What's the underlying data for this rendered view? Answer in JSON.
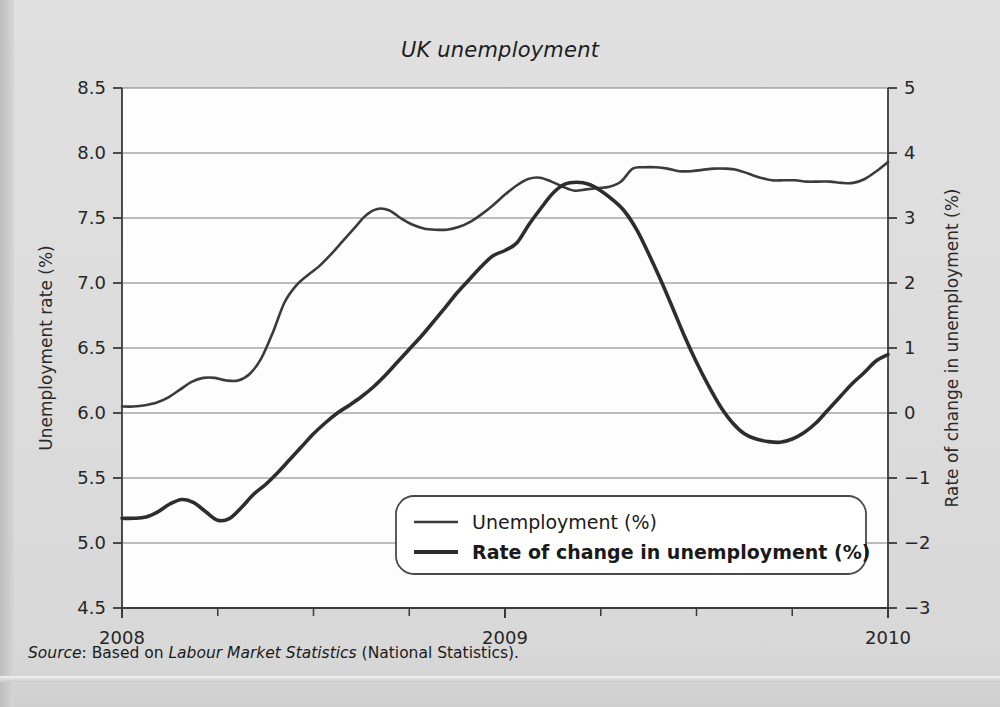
{
  "figure": {
    "title": "UK unemployment",
    "source_prefix": "Source",
    "source_text": ": Based on ",
    "source_italic": "Labour Market Statistics",
    "source_suffix": " (National Statistics)."
  },
  "chart_data": {
    "type": "line",
    "title": "UK unemployment",
    "xlabel": "",
    "x_tick_labels": [
      "2008",
      "2009",
      "2010"
    ],
    "x_tick_values": [
      2008,
      2009,
      2010
    ],
    "xlim": [
      2008,
      2010
    ],
    "x_minor_ticks_per_interval": 4,
    "grid": "horizontal",
    "legend_position": "lower-center",
    "axes": [
      {
        "side": "left",
        "label": "Unemployment rate (%)",
        "lim": [
          4.5,
          8.5
        ],
        "ticks": [
          4.5,
          5.0,
          5.5,
          6.0,
          6.5,
          7.0,
          7.5,
          8.0,
          8.5
        ],
        "tick_labels": [
          "4.5",
          "5.0",
          "5.5",
          "6.0",
          "6.5",
          "7.0",
          "7.5",
          "8.0",
          "8.5"
        ]
      },
      {
        "side": "right",
        "label": "Rate of change in unemployment (%)",
        "lim": [
          -3,
          5
        ],
        "ticks": [
          -3,
          -2,
          -1,
          0,
          1,
          2,
          3,
          4,
          5
        ],
        "tick_labels": [
          "−3",
          "−2",
          "−1",
          "0",
          "1",
          "2",
          "3",
          "4",
          "5"
        ]
      }
    ],
    "series": [
      {
        "name": "Unemployment (%)",
        "axis": "left",
        "color": "#3b3b3b",
        "width": 2.6,
        "x": [
          2008.0,
          2008.04,
          2008.08,
          2008.13,
          2008.17,
          2008.21,
          2008.25,
          2008.29,
          2008.33,
          2008.38,
          2008.42,
          2008.46,
          2008.5,
          2008.54,
          2008.58,
          2008.63,
          2008.67,
          2008.71,
          2008.75,
          2008.79,
          2008.83,
          2008.88,
          2008.92,
          2008.96,
          2009.0,
          2009.04,
          2009.08,
          2009.13,
          2009.17,
          2009.21,
          2009.25,
          2009.29,
          2009.33,
          2009.38,
          2009.42,
          2009.46,
          2009.5,
          2009.54,
          2009.58,
          2009.63,
          2009.67,
          2009.71,
          2009.75,
          2009.79,
          2009.83,
          2009.88,
          2009.92,
          2009.96,
          2010.0
        ],
        "y": [
          6.05,
          6.05,
          6.06,
          6.08,
          6.12,
          6.18,
          6.24,
          6.27,
          6.27,
          6.25,
          6.25,
          6.3,
          6.42,
          6.62,
          6.85,
          6.98,
          7.06,
          7.13,
          7.22,
          7.32,
          7.42,
          7.52,
          7.57,
          7.56,
          7.5,
          7.45,
          7.42,
          7.41,
          7.41,
          7.43,
          7.47,
          7.53,
          7.6,
          7.68,
          7.75,
          7.8,
          7.81,
          7.78,
          7.74,
          7.71,
          7.72,
          7.73,
          7.74,
          7.78,
          7.88,
          7.89,
          7.89,
          7.88,
          7.86
        ],
        "y_extra": [
          7.86,
          7.87,
          7.88,
          7.88,
          7.87,
          7.84,
          7.81,
          7.79,
          7.79,
          7.79,
          7.78,
          7.78,
          7.78,
          7.77,
          7.77,
          7.8,
          7.86,
          7.93
        ]
      },
      {
        "name": "Rate of change in unemployment (%)",
        "axis": "right",
        "color": "#2d2d2d",
        "width": 3.6,
        "x": [
          2008.0,
          2008.04,
          2008.08,
          2008.13,
          2008.17,
          2008.21,
          2008.25,
          2008.29,
          2008.33,
          2008.38,
          2008.42,
          2008.46,
          2008.5,
          2008.54,
          2008.58,
          2008.63,
          2008.67,
          2008.71,
          2008.75,
          2008.79,
          2008.83,
          2008.88,
          2008.92,
          2008.96,
          2009.0,
          2009.04,
          2009.08,
          2009.13,
          2009.17,
          2009.21,
          2009.25,
          2009.29,
          2009.33,
          2009.38,
          2009.42,
          2009.46,
          2009.5,
          2009.54,
          2009.58,
          2009.63,
          2009.67,
          2009.71,
          2009.75,
          2009.79,
          2009.83,
          2009.88,
          2009.92,
          2009.96,
          2010.0
        ],
        "y": [
          -1.62,
          -1.62,
          -1.6,
          -1.52,
          -1.4,
          -1.33,
          -1.38,
          -1.52,
          -1.65,
          -1.62,
          -1.45,
          -1.25,
          -1.1,
          -0.92,
          -0.72,
          -0.52,
          -0.32,
          -0.15,
          0.0,
          0.12,
          0.25,
          0.4,
          0.58,
          0.78,
          0.98,
          1.18,
          1.4,
          1.62,
          1.85,
          2.05,
          2.25,
          2.42,
          2.5,
          2.62,
          2.9,
          3.15,
          3.38,
          3.52,
          3.55,
          3.52,
          3.42,
          3.28,
          3.1,
          2.82,
          2.45,
          2.05,
          1.62,
          1.18,
          0.78
        ],
        "y_extra": [
          0.42,
          0.1,
          -0.15,
          -0.32,
          -0.4,
          -0.44,
          -0.45,
          -0.4,
          -0.3,
          -0.15,
          0.05,
          0.25,
          0.45,
          0.62,
          0.8,
          0.9
        ]
      }
    ]
  },
  "legend": {
    "items": [
      {
        "label": "Unemployment (%)",
        "bold": false,
        "color": "#3b3b3b",
        "width": 2.6
      },
      {
        "label": "Rate of change in unemployment (%)",
        "bold": true,
        "color": "#2d2d2d",
        "width": 4.0
      }
    ]
  }
}
